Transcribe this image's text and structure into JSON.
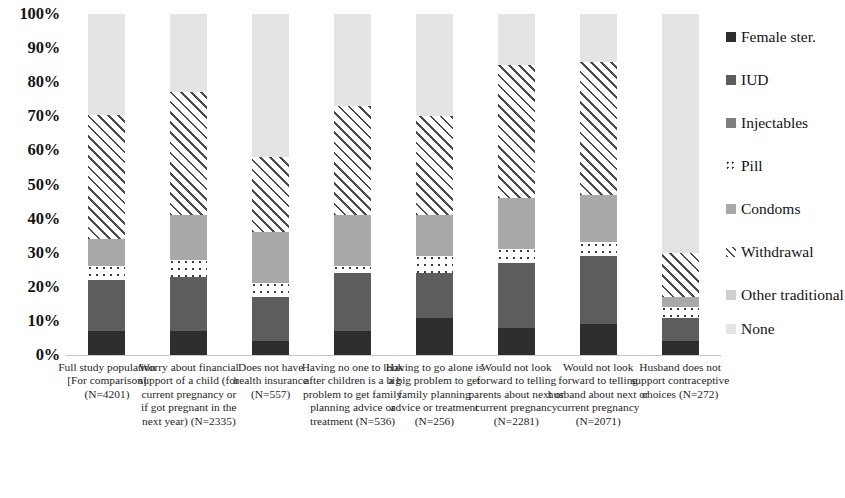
{
  "chart_data": {
    "type": "bar",
    "subtype": "stacked-100-percent",
    "title": "",
    "xlabel": "",
    "ylabel": "",
    "ylim": [
      0,
      100
    ],
    "y_tick_labels": [
      "100%",
      "90%",
      "80%",
      "70%",
      "60%",
      "50%",
      "40%",
      "30%",
      "20%",
      "10%",
      "0%"
    ],
    "y_tick_values": [
      100,
      90,
      80,
      70,
      60,
      50,
      40,
      30,
      20,
      10,
      0
    ],
    "grid": false,
    "legend_position": "right",
    "categories": [
      "Full study population [For comparison] (N=4201)",
      "Worry about financial support of a child (for current pregnancy or if got pregnant in the next year) (N=2335)",
      "Does not have health insurance (N=557)",
      "Having no one to look after children is a big problem to get family planning advice or treatment (N=536)",
      "Having to go alone is a big problem to get family planning advice or treatment (N=256)",
      "Would not look forward to telling parents about next or current pregnancy (N=2281)",
      "Would not look forward to telling husband about next or current pregnancy (N=2071)",
      "Husband does not support contraceptive choices (N=272)"
    ],
    "category_labels_display": [
      "Full study\npopulation [For\ncomparison]\n(N=4201)",
      "Worry about\nfinancial\nsupport of a\nchild (for\ncurrent\npregnancy or if\ngot pregnant in\nthe next year)\n(N=2335)",
      "Does not have\nhealth insurance\n(N=557)",
      "Having no one\nto look after\nchildren is a big\nproblem to get\nfamily planning\nadvice or\ntreatment\n(N=536)",
      "Having to go\nalone is a big\nproblem to get\nfamily planning\nadvice or\ntreatment\n(N=256)",
      "Would not look\nforward to\ntelling parents\nabout next or\ncurrent\npregnancy\n(N=2281)",
      "Would not look\nforward to\ntelling husband\nabout next or\ncurrent\npregnancy\n(N=2071)",
      "Husband does\nnot support\ncontraceptive\nchoices (N=272)"
    ],
    "series": [
      {
        "name": "Female ster.",
        "key": "female-ster",
        "color": "#2e2e2e",
        "pattern": "solid",
        "values": [
          7,
          7,
          4,
          7,
          11,
          8,
          9,
          4
        ]
      },
      {
        "name": "IUD",
        "key": "iud",
        "color": "#5d5d5d",
        "pattern": "solid",
        "values": [
          15,
          16,
          13,
          17,
          13,
          19,
          20,
          7
        ]
      },
      {
        "name": "Injectables",
        "key": "injectables",
        "color": "#7e7e7e",
        "pattern": "solid",
        "values": [
          0,
          0,
          0,
          0,
          0,
          0,
          0,
          0
        ]
      },
      {
        "name": "Pill",
        "key": "pill",
        "color": "#ffffff",
        "pattern": "dots",
        "values": [
          4,
          5,
          4,
          2,
          5,
          4,
          4,
          3
        ]
      },
      {
        "name": "Condoms",
        "key": "condoms",
        "color": "#a9a9a9",
        "pattern": "solid",
        "values": [
          8,
          13,
          15,
          15,
          12,
          15,
          14,
          3
        ]
      },
      {
        "name": "Withdrawal",
        "key": "withdrawal",
        "color": "#ffffff",
        "pattern": "hatch",
        "values": [
          36.5,
          36,
          22,
          32,
          29,
          39,
          39,
          13
        ]
      },
      {
        "name": "Other traditional",
        "key": "other-traditional",
        "color": "#cfcfcf",
        "pattern": "solid",
        "values": [
          0,
          0,
          0,
          0,
          0,
          0,
          0,
          0
        ]
      },
      {
        "name": "None",
        "key": "none",
        "color": "#e4e4e4",
        "pattern": "solid",
        "values": [
          29.5,
          23,
          42,
          27,
          30,
          15,
          14,
          70
        ]
      }
    ],
    "legend_entries": [
      {
        "label": "Female ster.",
        "key": "female-ster"
      },
      {
        "label": "IUD",
        "key": "iud"
      },
      {
        "label": "Injectables",
        "key": "injectables"
      },
      {
        "label": "Pill",
        "key": "pill"
      },
      {
        "label": "Condoms",
        "key": "condoms"
      },
      {
        "label": "Withdrawal",
        "key": "withdrawal"
      },
      {
        "label": "Other traditional",
        "key": "other-traditional"
      },
      {
        "label": "None",
        "key": "none"
      }
    ]
  }
}
